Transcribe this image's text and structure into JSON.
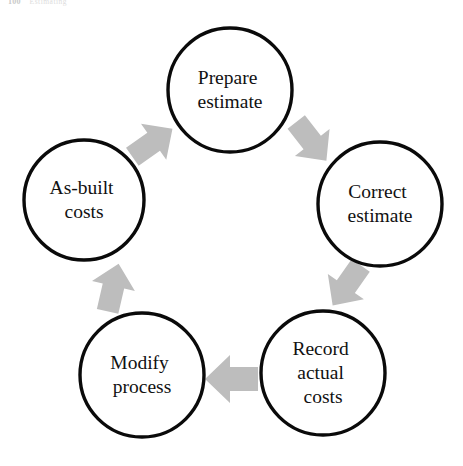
{
  "page_header": {
    "folio": "100",
    "running_head": "Estimating"
  },
  "diagram": {
    "type": "cycle",
    "direction": "clockwise",
    "colors": {
      "circle_stroke": "#0a0a0a",
      "circle_fill": "#ffffff",
      "arrow_fill": "#bdbdbd",
      "text": "#111111",
      "background": "#ffffff"
    },
    "nodes": [
      {
        "id": "prepare-estimate",
        "label": "Prepare estimate",
        "lines": [
          "Prepare",
          "estimate"
        ],
        "cx": 230,
        "cy": 90,
        "r": 62
      },
      {
        "id": "correct-estimate",
        "label": "Correct estimate",
        "lines": [
          "Correct",
          "estimate"
        ],
        "cx": 380,
        "cy": 204,
        "r": 62
      },
      {
        "id": "record-actual-costs",
        "label": "Record actual costs",
        "lines": [
          "Record",
          "actual",
          "costs"
        ],
        "cx": 323,
        "cy": 373,
        "r": 62
      },
      {
        "id": "modify-process",
        "label": "Modify process",
        "lines": [
          "Modify",
          "process"
        ],
        "cx": 142,
        "cy": 375,
        "r": 62
      },
      {
        "id": "as-built-costs",
        "label": "As-built costs",
        "lines": [
          "As-built",
          "costs"
        ],
        "cx": 84,
        "cy": 200,
        "r": 60
      }
    ],
    "arrows": [
      {
        "id": "arrow-prepare-to-correct",
        "from": "prepare-estimate",
        "to": "correct-estimate",
        "direction": "down-right",
        "rotation": 52,
        "cx": 311,
        "cy": 141
      },
      {
        "id": "arrow-correct-to-record",
        "from": "correct-estimate",
        "to": "record-actual-costs",
        "direction": "down-left",
        "rotation": 125,
        "cx": 347,
        "cy": 285
      },
      {
        "id": "arrow-record-to-modify",
        "from": "record-actual-costs",
        "to": "modify-process",
        "direction": "left",
        "rotation": 180,
        "cx": 232,
        "cy": 379
      },
      {
        "id": "arrow-modify-to-asbuilt",
        "from": "modify-process",
        "to": "as-built-costs",
        "direction": "up",
        "rotation": 283,
        "cx": 113,
        "cy": 288
      },
      {
        "id": "arrow-asbuilt-to-prepare",
        "from": "as-built-costs",
        "to": "prepare-estimate",
        "direction": "up-right",
        "rotation": 325,
        "cx": 152,
        "cy": 143
      }
    ]
  }
}
